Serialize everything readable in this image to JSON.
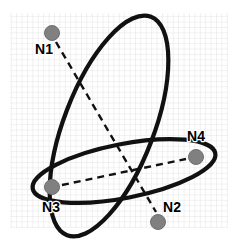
{
  "figure": {
    "type": "node-cluster-diagram",
    "background": {
      "paper_color": "#ffffff",
      "grid_color": "#e2e2e2",
      "grid_cell_px": 5.4,
      "grid_rect": {
        "x": 10,
        "y": 13,
        "width": 218,
        "height": 215
      }
    },
    "style": {
      "ellipse_stroke": "#111111",
      "ellipse_stroke_width": 4.2,
      "node_fill": "#808080",
      "node_stroke": "#6e6e6e",
      "node_radius": 7.5,
      "edge_color": "#111111",
      "edge_width": 2.4,
      "edge_dash": "7,5",
      "label_color": "#000000",
      "label_size_px": 14
    },
    "nodes": [
      {
        "id": "N1",
        "label": "N1",
        "cx": 52,
        "cy": 33,
        "label_x": 44,
        "label_y": 54,
        "anchor": "middle"
      },
      {
        "id": "N2",
        "label": "N2",
        "cx": 158,
        "cy": 222,
        "label_x": 172,
        "label_y": 212,
        "anchor": "middle"
      },
      {
        "id": "N3",
        "label": "N3",
        "cx": 52,
        "cy": 187,
        "label_x": 51,
        "label_y": 212,
        "anchor": "middle"
      },
      {
        "id": "N4",
        "label": "N4",
        "cx": 196,
        "cy": 157,
        "label_x": 196,
        "label_y": 141,
        "anchor": "middle"
      }
    ],
    "edges": [
      {
        "id": "edge-n1-n2",
        "from": "N1",
        "to": "N2",
        "x1": 56,
        "y1": 42,
        "x2": 156,
        "y2": 212,
        "dashed": true
      },
      {
        "id": "edge-n3-n4",
        "from": "N3",
        "to": "N4",
        "x1": 62,
        "y1": 185,
        "x2": 186,
        "y2": 159,
        "dashed": true
      }
    ],
    "clusters": [
      {
        "id": "cluster-vertical",
        "members": [
          "N1",
          "N2"
        ],
        "cx": 109,
        "cy": 126,
        "rx": 45,
        "ry": 117,
        "rotation_deg": 21
      },
      {
        "id": "cluster-horizontal",
        "members": [
          "N3",
          "N4"
        ],
        "cx": 124,
        "cy": 171,
        "rx": 93,
        "ry": 27,
        "rotation_deg": -11
      }
    ]
  }
}
